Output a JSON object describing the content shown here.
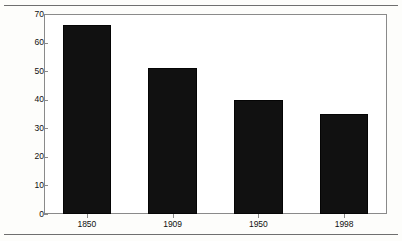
{
  "chart_data": {
    "type": "bar",
    "title": "",
    "subtitle": "",
    "xlabel": "",
    "ylabel": "Average Weekly Hours of Production Workers",
    "categories": [
      "1850",
      "1909",
      "1950",
      "1998"
    ],
    "values": [
      66,
      51,
      40,
      35
    ],
    "series": [
      {
        "name": "Average Weekly Hours of Production Workers",
        "values": [
          66,
          51,
          40,
          35
        ]
      }
    ],
    "ylim": [
      0,
      70
    ],
    "ytick_labels": [
      "0",
      "10",
      "20",
      "30",
      "40",
      "50",
      "60",
      "70"
    ],
    "ytick_values": [
      0,
      10,
      20,
      30,
      40,
      50,
      60,
      70
    ],
    "grid": false,
    "legend": false,
    "legend_position": "none",
    "bar_color": "#111111",
    "plot_background": "#ffffff",
    "page_background": "#fdfdfb",
    "axis_color": "#8a8a8a",
    "text_color": "#101010"
  },
  "figure": {
    "top_rule": "",
    "bottom_rule": ""
  }
}
